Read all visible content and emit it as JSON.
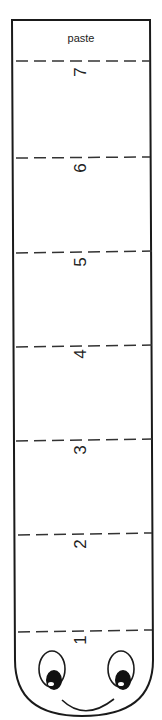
{
  "worksheet": {
    "paste_label": "paste",
    "segments": [
      {
        "label": "7",
        "fold_y": 61,
        "label_y": 72
      },
      {
        "label": "6",
        "fold_y": 158,
        "label_y": 168
      },
      {
        "label": "5",
        "fold_y": 252,
        "label_y": 262
      },
      {
        "label": "4",
        "fold_y": 346,
        "label_y": 354
      },
      {
        "label": "3",
        "fold_y": 440,
        "label_y": 450
      },
      {
        "label": "2",
        "fold_y": 534,
        "label_y": 544
      },
      {
        "label": "1",
        "fold_y": 631,
        "label_y": 640
      }
    ],
    "colors": {
      "line": "#1a1a1a",
      "background": "#ffffff"
    }
  }
}
